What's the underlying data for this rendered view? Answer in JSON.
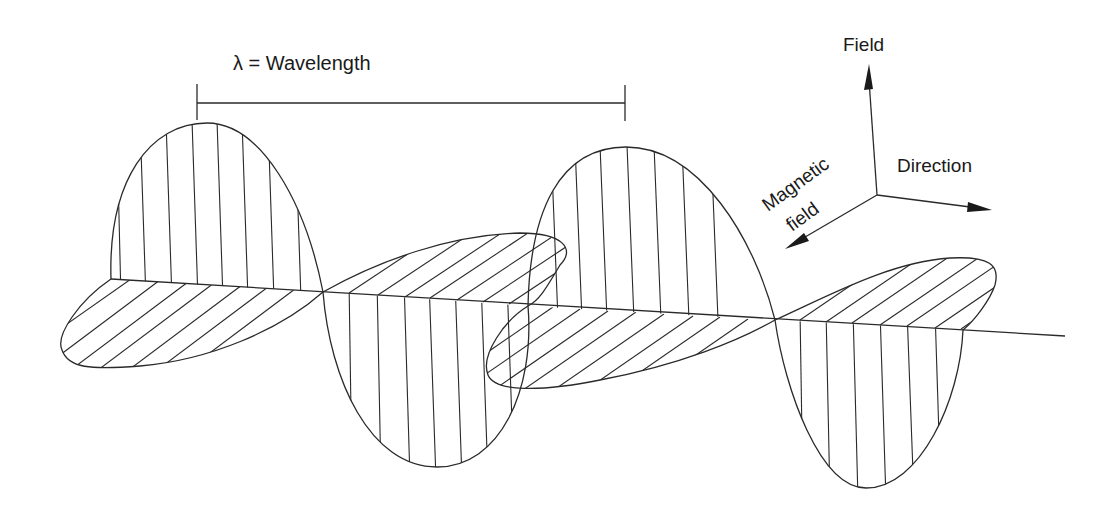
{
  "diagram": {
    "wavelength_label": "λ = Wavelength",
    "axes": {
      "vertical": "Field",
      "horizontal": "Direction",
      "diagonal_line1": "Magnetic",
      "diagonal_line2": "field"
    },
    "colors": {
      "line": "#2a2a2a",
      "background": "#ffffff"
    }
  }
}
